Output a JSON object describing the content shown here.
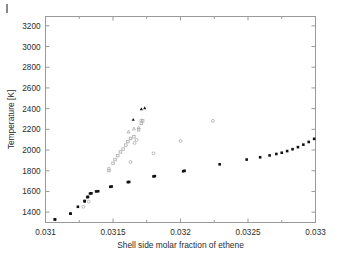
{
  "figure": {
    "background_color": "#ffffff",
    "axis_color": "#9a9a9a",
    "marker_dark_color": "#111111",
    "marker_light_color": "#b0b0b0",
    "corner_mark_label": "page-corner-mark"
  },
  "chart_data": {
    "type": "scatter",
    "title": "",
    "xlabel": "Shell side molar fraction of ethene",
    "ylabel": "Temperature [K]",
    "xlim": [
      0.031,
      0.033
    ],
    "ylim": [
      1300,
      3290
    ],
    "xticks": [
      0.031,
      0.0315,
      0.032,
      0.0325,
      0.033
    ],
    "xticklabels": [
      "0.031",
      "0.0315",
      "0.032",
      "0.0325",
      "0.033"
    ],
    "yticks": [
      1400,
      1600,
      1800,
      2000,
      2200,
      2400,
      2600,
      2800,
      3000,
      3200
    ],
    "yticklabels": [
      "1400",
      "1600",
      "1800",
      "2000",
      "2200",
      "2400",
      "2600",
      "2800",
      "3000",
      "3200"
    ],
    "grid": false,
    "legend": "none",
    "box": true,
    "series": [
      {
        "name": "branch-filled-squares",
        "marker": "filled-square",
        "color": "#111111",
        "size": 2.6,
        "points": [
          [
            0.03107,
            1330
          ],
          [
            0.031185,
            1385
          ],
          [
            0.03129,
            1505
          ],
          [
            0.03131,
            1545
          ],
          [
            0.03133,
            1580
          ],
          [
            0.031375,
            1600
          ],
          [
            0.03148,
            1645
          ],
          [
            0.03161,
            1690
          ],
          [
            0.0318,
            1745
          ],
          [
            0.03202,
            1795
          ],
          [
            0.03124,
            1452
          ],
          [
            0.034,
            0
          ]
        ]
      },
      {
        "name": "main-filled-square-curve",
        "marker": "filled-square",
        "color": "#111111",
        "size": 2.6,
        "points": [
          [
            0.03107,
            1330
          ],
          [
            0.031185,
            1385
          ],
          [
            0.03129,
            1508
          ],
          [
            0.031315,
            1548
          ],
          [
            0.03134,
            1582
          ],
          [
            0.03139,
            1602
          ],
          [
            0.03149,
            1648
          ],
          [
            0.03162,
            1692
          ],
          [
            0.03181,
            1748
          ],
          [
            0.03203,
            1800
          ],
          [
            0.03229,
            1862
          ],
          [
            0.03249,
            1908
          ],
          [
            0.03259,
            1930
          ],
          [
            0.03266,
            1948
          ],
          [
            0.03271,
            1962
          ],
          [
            0.03275,
            1974
          ],
          [
            0.03279,
            1990
          ],
          [
            0.03283,
            2008
          ],
          [
            0.03287,
            2028
          ],
          [
            0.03291,
            2052
          ],
          [
            0.03295,
            2078
          ],
          [
            0.03299,
            2108
          ],
          [
            0.03304,
            2140
          ],
          [
            0.0331,
            2180
          ],
          [
            0.03316,
            2228
          ],
          [
            0.03322,
            2285
          ],
          [
            0.03328,
            2352
          ],
          [
            0.03333,
            2398
          ],
          [
            0.03337,
            2412
          ],
          [
            0.03343,
            2398
          ],
          [
            0.03362,
            2412
          ],
          [
            0.03385,
            2528
          ],
          [
            0.0341,
            2718
          ],
          [
            0.03424,
            2760
          ],
          [
            0.03427,
            2782
          ],
          [
            0.0343,
            2800
          ],
          [
            0.03449,
            2838
          ],
          [
            0.0348,
            2928
          ],
          [
            0.03491,
            2952
          ],
          [
            0.03501,
            2968
          ],
          [
            0.03511,
            2982
          ],
          [
            0.03521,
            2994
          ],
          [
            0.03531,
            3000
          ],
          [
            0.03541,
            3001
          ],
          [
            0.03551,
            2996
          ],
          [
            0.0356,
            2986
          ],
          [
            0.03568,
            2972
          ],
          [
            0.03575,
            2954
          ],
          [
            0.03581,
            2932
          ],
          [
            0.03587,
            2906
          ],
          [
            0.03592,
            2876
          ],
          [
            0.03597,
            2842
          ],
          [
            0.03601,
            2806
          ],
          [
            0.03605,
            2766
          ],
          [
            0.03608,
            2724
          ],
          [
            0.03611,
            2680
          ],
          [
            0.03614,
            2634
          ],
          [
            0.03616,
            2588
          ],
          [
            0.03618,
            2542
          ],
          [
            0.03619,
            2496
          ],
          [
            0.0362,
            2452
          ],
          [
            0.03621,
            2420
          ],
          [
            0.0365,
            2478
          ],
          [
            0.0374,
            2980
          ]
        ]
      },
      {
        "name": "light-open-circles",
        "marker": "open-circle",
        "color": "#b0b0b0",
        "size": 2.9,
        "points": [
          [
            0.03128,
            1452
          ],
          [
            0.03132,
            1502
          ],
          [
            0.03147,
            1820
          ],
          [
            0.03163,
            1885
          ],
          [
            0.03171,
            2285
          ],
          [
            0.0318,
            1968
          ],
          [
            0.032,
            2088
          ],
          [
            0.03224,
            2282
          ],
          [
            0.03166,
            2068
          ],
          [
            0.031675,
            2098
          ]
        ]
      },
      {
        "name": "light-open-squares",
        "marker": "open-square",
        "color": "#b0b0b0",
        "size": 2.5,
        "points": [
          [
            0.03147,
            1802
          ],
          [
            0.0315,
            1872
          ],
          [
            0.031515,
            1908
          ],
          [
            0.031535,
            1946
          ],
          [
            0.031555,
            1982
          ],
          [
            0.031575,
            2010
          ],
          [
            0.031595,
            2048
          ],
          [
            0.03161,
            2082
          ],
          [
            0.03163,
            2112
          ],
          [
            0.031655,
            2128
          ],
          [
            0.03169,
            2196
          ],
          [
            0.03171,
            2258
          ],
          [
            0.03172,
            2282
          ]
        ]
      },
      {
        "name": "light-open-triangles",
        "marker": "open-triangle",
        "color": "#b0b0b0",
        "size": 3.0,
        "points": [
          [
            0.031615,
            2178
          ],
          [
            0.031655,
            2208
          ],
          [
            0.03169,
            2218
          ]
        ]
      },
      {
        "name": "dark-filled-triangles",
        "marker": "filled-triangle",
        "color": "#1a1a1a",
        "size": 3.2,
        "points": [
          [
            0.03165,
            2296
          ],
          [
            0.03171,
            2398
          ],
          [
            0.031735,
            2408
          ]
        ]
      }
    ]
  }
}
